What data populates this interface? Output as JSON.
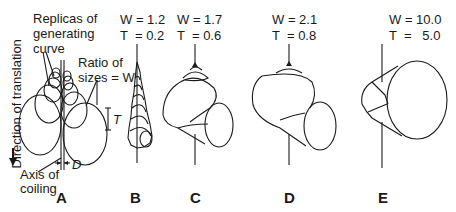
{
  "figure": {
    "axis_label_vertical": "Direction of translation",
    "panelA": {
      "label": "A",
      "replicas_label_line1": "Replicas of",
      "replicas_label_line2": "generating",
      "replicas_label_line3": "curve",
      "ratio_label_line1": "Ratio of",
      "ratio_label_line2": "sizes = W",
      "T_label": "T",
      "D_label": "D",
      "axis_label_line1": "Axis of",
      "axis_label_line2": "coiling"
    },
    "panels": [
      {
        "label": "B",
        "W": "W = 1.2",
        "T": "T  = 0.2"
      },
      {
        "label": "C",
        "W": "W = 1.7",
        "T": "T  = 0.6"
      },
      {
        "label": "D",
        "W": "W = 2.1",
        "T": "T  = 0.8"
      },
      {
        "label": "E",
        "W": "W = 10.0",
        "T": "T  =   5.0"
      }
    ]
  }
}
